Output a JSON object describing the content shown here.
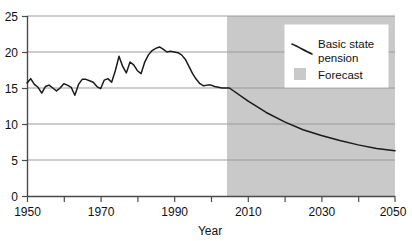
{
  "chart_data": {
    "type": "line",
    "title": "",
    "xlabel": "Year",
    "ylabel": "",
    "xlim": [
      1950,
      2050
    ],
    "ylim": [
      0,
      25
    ],
    "grid": true,
    "xticks": [
      1950,
      1960,
      1970,
      1980,
      1990,
      2000,
      2010,
      2020,
      2030,
      2040,
      2050
    ],
    "xtick_labels": [
      "1950",
      "",
      "1970",
      "",
      "1990",
      "",
      "2010",
      "",
      "2030",
      "",
      "2050"
    ],
    "yticks": [
      0,
      5,
      10,
      15,
      20,
      25
    ],
    "ytick_labels": [
      "0",
      "5",
      "10",
      "15",
      "20",
      "25"
    ],
    "legend_position": "top-right",
    "legend": [
      {
        "name": "Basic state pension",
        "type": "line",
        "color": "#1a1a1a"
      },
      {
        "name": "Forecast",
        "type": "area",
        "color": "#c9c9c9"
      }
    ],
    "forecast_start": 2005,
    "forecast_shading_color": "#c9c9c9",
    "series": [
      {
        "name": "Basic state pension",
        "color": "#1a1a1a",
        "x": [
          1950,
          1951,
          1952,
          1953,
          1954,
          1955,
          1956,
          1957,
          1958,
          1959,
          1960,
          1961,
          1962,
          1963,
          1964,
          1965,
          1966,
          1967,
          1968,
          1969,
          1970,
          1971,
          1972,
          1973,
          1974,
          1975,
          1976,
          1977,
          1978,
          1979,
          1980,
          1981,
          1982,
          1983,
          1984,
          1985,
          1986,
          1987,
          1988,
          1989,
          1990,
          1991,
          1992,
          1993,
          1994,
          1995,
          1996,
          1997,
          1998,
          1999,
          2000,
          2001,
          2002,
          2003,
          2004,
          2005,
          2010,
          2015,
          2020,
          2025,
          2030,
          2035,
          2040,
          2045,
          2050
        ],
        "values": [
          15.7,
          16.3,
          15.5,
          15.1,
          14.3,
          15.2,
          15.4,
          15.0,
          14.6,
          15.0,
          15.6,
          15.4,
          15.1,
          14.0,
          15.5,
          16.2,
          16.2,
          16.0,
          15.8,
          15.2,
          14.9,
          16.1,
          16.3,
          15.8,
          17.4,
          19.4,
          18.0,
          17.1,
          18.6,
          18.2,
          17.4,
          17.0,
          18.6,
          19.6,
          20.2,
          20.5,
          20.7,
          20.4,
          20.0,
          20.1,
          20.0,
          19.9,
          19.6,
          19.0,
          18.0,
          17.0,
          16.2,
          15.6,
          15.3,
          15.4,
          15.4,
          15.2,
          15.1,
          15.0,
          15.0,
          15.0,
          13.2,
          11.6,
          10.3,
          9.2,
          8.4,
          7.7,
          7.1,
          6.6,
          6.3
        ]
      }
    ]
  },
  "axis": {
    "x_label": "Year"
  },
  "legend": {
    "line_label_line1": "Basic state",
    "line_label_line2": "pension",
    "area_label": "Forecast"
  },
  "yaxis": {
    "labels": [
      "25",
      "20",
      "15",
      "10",
      "5",
      "0"
    ]
  },
  "xaxis": {
    "labels": [
      "1950",
      "1970",
      "1990",
      "2010",
      "2030",
      "2050"
    ]
  },
  "colors": {
    "line": "#1a1a1a",
    "forecast_band": "#c9c9c9",
    "grid": "#9a9a9a",
    "axis": "#4a4a4a",
    "text": "#111111"
  }
}
